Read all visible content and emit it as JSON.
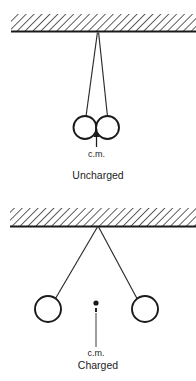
{
  "figure": {
    "background_color": "#ffffff",
    "ink_color": "#1a1a1a",
    "panels": [
      {
        "id": "uncharged",
        "caption": "Uncharged",
        "caption_x": 98,
        "caption_y": 179,
        "ceiling": {
          "name": "hatched-ceiling",
          "x": 11,
          "y": 14,
          "width": 185,
          "height": 18,
          "baseline_y": 31.5,
          "hatch_angle_deg": 45,
          "hatch_spacing": 5.6
        },
        "pivot": {
          "x": 98,
          "y": 32.5
        },
        "strings": [
          {
            "name": "string-left",
            "x1": 97.4,
            "y1": 32.5,
            "x2": 86.0,
            "y2": 116.5
          },
          {
            "name": "string-right",
            "x1": 98.6,
            "y1": 32.5,
            "x2": 107.5,
            "y2": 116.5
          }
        ],
        "spheres": [
          {
            "name": "sphere-left",
            "cx": 85.0,
            "cy": 127.5,
            "r": 11.5
          },
          {
            "name": "sphere-right",
            "cx": 107.5,
            "cy": 127.5,
            "r": 11.5
          }
        ],
        "cm_marker": {
          "type": "arrow-up",
          "tip_x": 96.5,
          "tip_y": 131.0,
          "tail_x": 96.5,
          "tail_y": 147.0,
          "label": "c.m.",
          "label_x": 96.5,
          "label_y": 157.0
        }
      },
      {
        "id": "charged",
        "caption": "Charged",
        "caption_x": 98,
        "caption_y": 369,
        "ceiling": {
          "name": "hatched-ceiling",
          "x": 10,
          "y": 208,
          "width": 186,
          "height": 18,
          "baseline_y": 226.5,
          "hatch_angle_deg": 45,
          "hatch_spacing": 5.6
        },
        "pivot": {
          "x": 98,
          "y": 227
        },
        "strings": [
          {
            "name": "string-left",
            "x1": 97.4,
            "y1": 227,
            "x2": 55.5,
            "y2": 298.5
          },
          {
            "name": "string-right",
            "x1": 98.6,
            "y1": 227,
            "x2": 137.0,
            "y2": 298.5
          }
        ],
        "spheres": [
          {
            "name": "sphere-left",
            "cx": 48.0,
            "cy": 309.0,
            "r": 13.0
          },
          {
            "name": "sphere-right",
            "cx": 145.0,
            "cy": 309.0,
            "r": 13.0
          }
        ],
        "cm_marker": {
          "type": "dot-with-leader",
          "dot_x": 96.0,
          "dot_y": 303.0,
          "dot_r": 2.6,
          "dash_x": 96.0,
          "dash_y1": 308.0,
          "dash_y2": 312.0,
          "leader_x": 96.0,
          "leader_y1": 313.0,
          "leader_y2": 347.0,
          "label": "c.m.",
          "label_x": 96.0,
          "label_y": 356.0
        }
      }
    ]
  }
}
